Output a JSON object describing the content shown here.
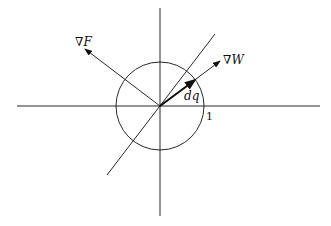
{
  "diagram": {
    "labels": {
      "grad_f": "∇F",
      "grad_w": "∇W",
      "dq": "dq",
      "unit_radius": "1"
    },
    "colors": {
      "stroke": "#111111",
      "background": "#ffffff"
    }
  }
}
